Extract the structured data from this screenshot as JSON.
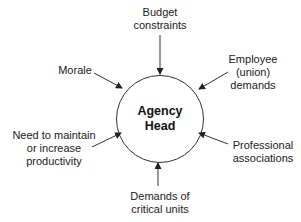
{
  "diagram": {
    "center": {
      "line1": "Agency",
      "line2": "Head"
    },
    "inputs": [
      {
        "id": "budget",
        "lines": [
          "Budget",
          "constraints"
        ]
      },
      {
        "id": "employee",
        "lines": [
          "Employee",
          "(union)",
          "demands"
        ]
      },
      {
        "id": "professional",
        "lines": [
          "Professional",
          "associations"
        ]
      },
      {
        "id": "critical",
        "lines": [
          "Demands of",
          "critical units"
        ]
      },
      {
        "id": "productivity",
        "lines": [
          "Need to maintain",
          "or increase",
          "productivity"
        ]
      },
      {
        "id": "morale",
        "lines": [
          "Morale"
        ]
      }
    ],
    "colors": {
      "stroke": "#333333",
      "background": "#ffffff"
    }
  }
}
